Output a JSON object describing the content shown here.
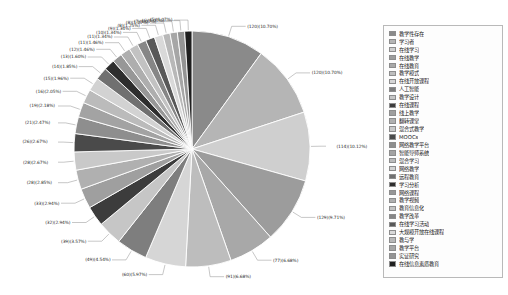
{
  "chart_data": {
    "type": "pie",
    "title": "",
    "xlabel": "",
    "ylabel": "",
    "legend_position": "right",
    "grid": false,
    "label_format": "(count)(percent%)",
    "categories": [
      "教学性存在",
      "学习者",
      "在线学习",
      "在线教学",
      "在线教育",
      "教学模式",
      "在线开放课程",
      "人工智能",
      "教学设计",
      "在线课程",
      "线上教学",
      "翻转课堂",
      "混合式教学",
      "MOOCs",
      "网络教学平台",
      "智能导师系统",
      "混合学习",
      "网络教学",
      "远程教育",
      "学习分析",
      "网络课程",
      "教学视频",
      "教育信息化",
      "教学改革",
      "在线学习活动",
      "大规模开放在线课程",
      "教与学",
      "教学平台",
      "实证研究",
      "在线信息素质教育"
    ],
    "counts": [
      120,
      120,
      114,
      129,
      77,
      91,
      60,
      49,
      39,
      32,
      33,
      28,
      28,
      26,
      21,
      19,
      16,
      15,
      14,
      13,
      12,
      11,
      11,
      10,
      9,
      8,
      8,
      7,
      6,
      5
    ],
    "percents": [
      10.7,
      10.7,
      10.12,
      9.71,
      6.68,
      6.68,
      5.97,
      4.54,
      3.57,
      2.94,
      2.94,
      2.85,
      2.67,
      2.67,
      2.47,
      2.18,
      2.05,
      1.96,
      1.85,
      1.6,
      1.46,
      1.46,
      1.34,
      1.34,
      1.34,
      1.25,
      1.07,
      1.07,
      1.07,
      1.07
    ],
    "labels": [
      "(120)(10.70%)",
      "(120)(10.70%)",
      "(114)(10.12%)",
      "(129)(9.71%)",
      "(77)(6.68%)",
      "(91)(6.68%)",
      "(60)(5.97%)",
      "(49)(4.54%)",
      "(39)(3.57%)",
      "(32)(2.94%)",
      "(33)(2.94%)",
      "(28)(2.85%)",
      "(28)(2.67%)",
      "(26)(2.67%)",
      "(21)(2.47%)",
      "(19)(2.18%)",
      "(16)(2.05%)",
      "(15)(1.96%)",
      "(14)(1.85%)",
      "(13)(1.60%)",
      "(12)(1.46%)",
      "(11)(1.46%)",
      "(11)(1.34%)",
      "(10)(1.34%)",
      "(9)(1.34%)",
      "(8)(1.25%)",
      "(8)(1.07%)",
      "(7)(1.07%)",
      "(6)(1.07%)",
      "(5)(1.07%)"
    ],
    "colors": [
      "#8a8a8a",
      "#b5b5b5",
      "#cfcfcf",
      "#9c9c9c",
      "#a8a8a8",
      "#bdbdbd",
      "#d6d6d6",
      "#7e7e7e",
      "#c6c6c6",
      "#3c3c3c",
      "#9f9f9f",
      "#b0b0b0",
      "#c9c9c9",
      "#4a4a4a",
      "#8e8e8e",
      "#a3a3a3",
      "#bbbbbb",
      "#d2d2d2",
      "#707070",
      "#2e2e2e",
      "#979797",
      "#aeaeae",
      "#c2c2c2",
      "#868686",
      "#585858",
      "#d9d9d9",
      "#b8b8b8",
      "#a6a6a6",
      "#949494",
      "#1f1f1f"
    ]
  },
  "legend": {
    "items": [
      {
        "label": "教学性存在",
        "color": "#8a8a8a"
      },
      {
        "label": "学习者",
        "color": "#b5b5b5"
      },
      {
        "label": "在线学习",
        "color": "#cfcfcf"
      },
      {
        "label": "在线教学",
        "color": "#9c9c9c"
      },
      {
        "label": "在线教育",
        "color": "#a8a8a8"
      },
      {
        "label": "教学模式",
        "color": "#bdbdbd"
      },
      {
        "label": "在线开放课程",
        "color": "#d6d6d6"
      },
      {
        "label": "人工智能",
        "color": "#7e7e7e"
      },
      {
        "label": "教学设计",
        "color": "#c6c6c6"
      },
      {
        "label": "在线课程",
        "color": "#3c3c3c"
      },
      {
        "label": "线上教学",
        "color": "#9f9f9f"
      },
      {
        "label": "翻转课堂",
        "color": "#b0b0b0"
      },
      {
        "label": "混合式教学",
        "color": "#c9c9c9"
      },
      {
        "label": "MOOCs",
        "color": "#4a4a4a"
      },
      {
        "label": "网络教学平台",
        "color": "#8e8e8e"
      },
      {
        "label": "智能导师系统",
        "color": "#a3a3a3"
      },
      {
        "label": "混合学习",
        "color": "#bbbbbb"
      },
      {
        "label": "网络教学",
        "color": "#d2d2d2"
      },
      {
        "label": "远程教育",
        "color": "#707070"
      },
      {
        "label": "学习分析",
        "color": "#2e2e2e"
      },
      {
        "label": "网络课程",
        "color": "#979797"
      },
      {
        "label": "教学视频",
        "color": "#aeaeae"
      },
      {
        "label": "教育信息化",
        "color": "#c2c2c2"
      },
      {
        "label": "教学改革",
        "color": "#868686"
      },
      {
        "label": "在线学习活动",
        "color": "#585858"
      },
      {
        "label": "大规模开放在线课程",
        "color": "#d9d9d9"
      },
      {
        "label": "教与学",
        "color": "#b8b8b8"
      },
      {
        "label": "教学平台",
        "color": "#a6a6a6"
      },
      {
        "label": "实证研究",
        "color": "#949494"
      },
      {
        "label": "在线信息素质教育",
        "color": "#1f1f1f"
      }
    ]
  }
}
